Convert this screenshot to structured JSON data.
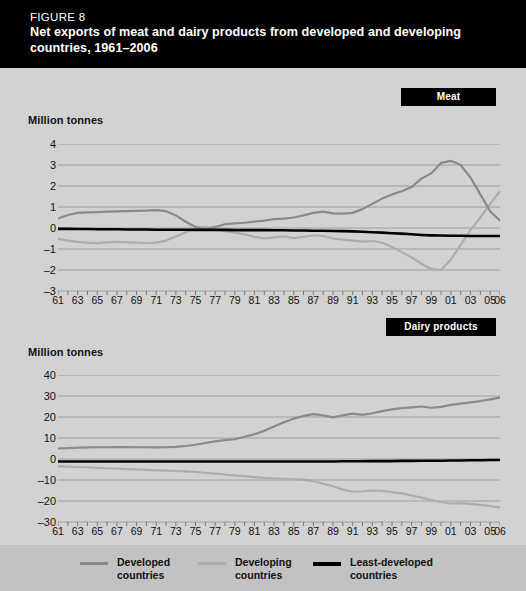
{
  "figure": {
    "number": "FIGURE 8",
    "title": "Net exports of meat and dairy products from developed and developing countries, 1961–2006"
  },
  "colors": {
    "developed": "#8a8a8a",
    "developing": "#adadad",
    "least_developed": "#000000",
    "header_bg": "#000000",
    "panel_bg": "#d2d2d2",
    "page_bg": "#c9c9c9",
    "legend_bg": "#c2c2c2",
    "gridline": "#9a9a9a"
  },
  "legend": {
    "position": "bottom",
    "items": [
      {
        "label": "Developed\ncountries",
        "color": "#8a8a8a",
        "style": "thin"
      },
      {
        "label": "Developing\ncountries",
        "color": "#adadad",
        "style": "thin"
      },
      {
        "label": "Least-developed\ncountries",
        "color": "#000000",
        "style": "thick"
      }
    ]
  },
  "chart_data": [
    {
      "type": "line",
      "title": "Meat",
      "ylabel": "Million tonnes",
      "xlabel": "",
      "ylim": [
        -3,
        4
      ],
      "yticks": [
        4,
        3,
        2,
        1,
        0,
        -1,
        -2,
        -3
      ],
      "ytick_labels": [
        "4",
        "3",
        "2",
        "1",
        "0",
        "–1",
        "–2",
        "–3"
      ],
      "xlim": [
        1961,
        2006
      ],
      "xticks": [
        1961,
        1963,
        1965,
        1967,
        1969,
        1971,
        1973,
        1975,
        1977,
        1979,
        1981,
        1983,
        1985,
        1987,
        1989,
        1991,
        1993,
        1995,
        1997,
        1999,
        2001,
        2003,
        2005,
        2006
      ],
      "xtick_labels": [
        "61",
        "63",
        "65",
        "67",
        "69",
        "71",
        "73",
        "75",
        "77",
        "79",
        "81",
        "83",
        "85",
        "87",
        "89",
        "91",
        "93",
        "95",
        "97",
        "99",
        "01",
        "03",
        "05",
        "06"
      ],
      "grid": true,
      "x": [
        1961,
        1962,
        1963,
        1964,
        1965,
        1966,
        1967,
        1968,
        1969,
        1970,
        1971,
        1972,
        1973,
        1974,
        1975,
        1976,
        1977,
        1978,
        1979,
        1980,
        1981,
        1982,
        1983,
        1984,
        1985,
        1986,
        1987,
        1988,
        1989,
        1990,
        1991,
        1992,
        1993,
        1994,
        1995,
        1996,
        1997,
        1998,
        1999,
        2000,
        2001,
        2002,
        2003,
        2004,
        2005,
        2006
      ],
      "series": [
        {
          "name": "Developed countries",
          "color": "#8a8a8a",
          "values": [
            0.45,
            0.62,
            0.72,
            0.74,
            0.76,
            0.78,
            0.79,
            0.8,
            0.82,
            0.83,
            0.85,
            0.8,
            0.6,
            0.3,
            0.05,
            -0.05,
            0.05,
            0.18,
            0.22,
            0.25,
            0.3,
            0.35,
            0.42,
            0.45,
            0.5,
            0.6,
            0.72,
            0.78,
            0.7,
            0.68,
            0.72,
            0.9,
            1.15,
            1.4,
            1.6,
            1.75,
            1.95,
            2.35,
            2.6,
            3.1,
            3.2,
            3.0,
            2.4,
            1.6,
            0.8,
            0.35
          ]
        },
        {
          "name": "Developing countries",
          "color": "#adadad",
          "values": [
            -0.52,
            -0.6,
            -0.66,
            -0.7,
            -0.72,
            -0.68,
            -0.66,
            -0.68,
            -0.7,
            -0.72,
            -0.7,
            -0.6,
            -0.4,
            -0.2,
            0.0,
            0.05,
            -0.05,
            -0.15,
            -0.22,
            -0.3,
            -0.42,
            -0.5,
            -0.45,
            -0.4,
            -0.48,
            -0.42,
            -0.35,
            -0.38,
            -0.5,
            -0.55,
            -0.6,
            -0.65,
            -0.62,
            -0.7,
            -0.9,
            -1.15,
            -1.4,
            -1.7,
            -1.95,
            -2.0,
            -1.5,
            -0.8,
            -0.1,
            0.5,
            1.15,
            1.75
          ]
        },
        {
          "name": "Least-developed countries",
          "color": "#000000",
          "values": [
            -0.04,
            -0.04,
            -0.05,
            -0.05,
            -0.06,
            -0.06,
            -0.06,
            -0.07,
            -0.07,
            -0.07,
            -0.08,
            -0.08,
            -0.08,
            -0.08,
            -0.09,
            -0.09,
            -0.09,
            -0.09,
            -0.1,
            -0.1,
            -0.1,
            -0.1,
            -0.11,
            -0.11,
            -0.12,
            -0.12,
            -0.13,
            -0.13,
            -0.14,
            -0.15,
            -0.16,
            -0.18,
            -0.2,
            -0.22,
            -0.25,
            -0.27,
            -0.3,
            -0.33,
            -0.35,
            -0.36,
            -0.37,
            -0.37,
            -0.38,
            -0.38,
            -0.38,
            -0.38
          ]
        }
      ]
    },
    {
      "type": "line",
      "title": "Dairy products",
      "ylabel": "Million tonnes",
      "xlabel": "",
      "ylim": [
        -30,
        40
      ],
      "yticks": [
        40,
        30,
        20,
        10,
        0,
        -10,
        -20,
        -30
      ],
      "ytick_labels": [
        "40",
        "30",
        "20",
        "10",
        "0",
        "–10",
        "–20",
        "–30"
      ],
      "xlim": [
        1961,
        2006
      ],
      "xticks": [
        1961,
        1963,
        1965,
        1967,
        1969,
        1971,
        1973,
        1975,
        1977,
        1979,
        1981,
        1983,
        1985,
        1987,
        1989,
        1991,
        1993,
        1995,
        1997,
        1999,
        2001,
        2003,
        2005,
        2006
      ],
      "xtick_labels": [
        "61",
        "63",
        "65",
        "67",
        "69",
        "71",
        "73",
        "75",
        "77",
        "79",
        "81",
        "83",
        "85",
        "87",
        "89",
        "91",
        "93",
        "95",
        "97",
        "99",
        "01",
        "03",
        "05",
        "06"
      ],
      "grid": true,
      "x": [
        1961,
        1962,
        1963,
        1964,
        1965,
        1966,
        1967,
        1968,
        1969,
        1970,
        1971,
        1972,
        1973,
        1974,
        1975,
        1976,
        1977,
        1978,
        1979,
        1980,
        1981,
        1982,
        1983,
        1984,
        1985,
        1986,
        1987,
        1988,
        1989,
        1990,
        1991,
        1992,
        1993,
        1994,
        1995,
        1996,
        1997,
        1998,
        1999,
        2000,
        2001,
        2002,
        2003,
        2004,
        2005,
        2006
      ],
      "series": [
        {
          "name": "Developed countries",
          "color": "#8a8a8a",
          "values": [
            5.0,
            5.2,
            5.4,
            5.5,
            5.6,
            5.6,
            5.7,
            5.7,
            5.6,
            5.6,
            5.5,
            5.6,
            5.8,
            6.2,
            6.8,
            7.6,
            8.4,
            9.0,
            9.4,
            10.6,
            11.8,
            13.4,
            15.5,
            17.5,
            19.2,
            20.5,
            21.4,
            20.8,
            19.8,
            20.8,
            21.6,
            21.0,
            21.8,
            22.8,
            23.6,
            24.2,
            24.6,
            25.0,
            24.4,
            24.8,
            25.8,
            26.4,
            27.0,
            27.6,
            28.4,
            29.2
          ]
        },
        {
          "name": "Developing countries",
          "color": "#adadad",
          "values": [
            -3.4,
            -3.6,
            -3.8,
            -4.0,
            -4.2,
            -4.4,
            -4.6,
            -4.8,
            -5.0,
            -5.2,
            -5.4,
            -5.5,
            -5.7,
            -5.9,
            -6.2,
            -6.6,
            -7.0,
            -7.4,
            -7.8,
            -8.2,
            -8.6,
            -9.0,
            -9.2,
            -9.4,
            -9.6,
            -9.8,
            -10.6,
            -11.8,
            -13.0,
            -14.6,
            -15.6,
            -15.4,
            -15.0,
            -15.2,
            -15.8,
            -16.4,
            -17.4,
            -18.4,
            -19.6,
            -20.6,
            -21.2,
            -21.0,
            -21.4,
            -21.8,
            -22.4,
            -23.0
          ]
        },
        {
          "name": "Least-developed countries",
          "color": "#000000",
          "values": [
            -1.2,
            -1.2,
            -1.2,
            -1.2,
            -1.2,
            -1.2,
            -1.2,
            -1.2,
            -1.2,
            -1.2,
            -1.2,
            -1.2,
            -1.2,
            -1.2,
            -1.2,
            -1.2,
            -1.2,
            -1.2,
            -1.2,
            -1.2,
            -1.2,
            -1.2,
            -1.2,
            -1.2,
            -1.2,
            -1.2,
            -1.2,
            -1.2,
            -1.2,
            -1.1,
            -1.1,
            -1.1,
            -1.0,
            -1.0,
            -1.0,
            -0.9,
            -0.9,
            -0.8,
            -0.8,
            -0.8,
            -0.7,
            -0.7,
            -0.6,
            -0.6,
            -0.5,
            -0.5
          ]
        }
      ]
    }
  ]
}
